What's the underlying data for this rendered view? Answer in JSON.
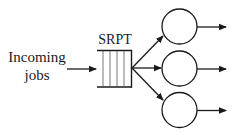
{
  "diagram": {
    "type": "queueing-system",
    "input_label_line1": "Incoming",
    "input_label_line2": "jobs",
    "queue_label": "SRPT",
    "queue_slots": 5,
    "server_count": 3,
    "servers": [
      {
        "id": "server-1"
      },
      {
        "id": "server-2"
      },
      {
        "id": "server-3"
      }
    ],
    "colors": {
      "stroke": "#1a1a1a",
      "slot_line": "#555555",
      "background": "#ffffff"
    }
  }
}
